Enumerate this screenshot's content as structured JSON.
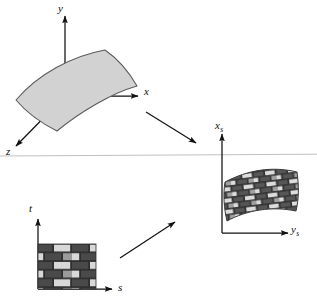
{
  "figure": {
    "kind": "texture-mapping-diagram",
    "background": "#ffffff",
    "divider_y": 155,
    "width": 317,
    "height": 299
  },
  "colors": {
    "stroke": "#1a1a1a",
    "surface_fill": "#d2d2d2",
    "surface_stroke": "#4d4d4d",
    "brick_dark": "#4a4a4a",
    "brick_light": "#d8d8d8",
    "brick_mid": "#9a9a9a",
    "mortar": "#2e2e2e",
    "divider": "#b9b9b9",
    "label": "#0d0d0d"
  },
  "panels": {
    "object_space": {
      "name": "object-space-panel",
      "axes": [
        {
          "id": "y-axis",
          "label": "y",
          "subscript": "",
          "direction": "up",
          "label_x": 58,
          "label_y": 3
        },
        {
          "id": "x-axis",
          "label": "x",
          "subscript": "",
          "direction": "right",
          "label_x": 144,
          "label_y": 91
        },
        {
          "id": "z-axis",
          "label": "z",
          "subscript": "",
          "direction": "down-left",
          "label_x": 6,
          "label_y": 152
        }
      ],
      "surface": {
        "name": "gray-curved-surface",
        "textured": false,
        "fill": "#d2d2d2"
      }
    },
    "texture_space": {
      "name": "texture-space-panel",
      "axes": [
        {
          "id": "t-axis",
          "label": "t",
          "subscript": "",
          "direction": "up",
          "label_x": 28,
          "label_y": 207
        },
        {
          "id": "s-axis",
          "label": "s",
          "subscript": "",
          "direction": "right",
          "label_x": 118,
          "label_y": 278
        }
      ],
      "patch": {
        "name": "brick-texture-square",
        "pattern": "running-bond-brick",
        "rows": 5,
        "cols": 3
      }
    },
    "screen_space": {
      "name": "screen-space-panel",
      "axes": [
        {
          "id": "xs-axis",
          "label": "x",
          "subscript": "s",
          "direction": "up",
          "label_x": 216,
          "label_y": 122
        },
        {
          "id": "ys-axis",
          "label": "y",
          "subscript": "s",
          "direction": "right",
          "label_x": 291,
          "label_y": 228
        }
      ],
      "surface": {
        "name": "textured-curved-surface",
        "textured": true,
        "pattern": "running-bond-brick"
      }
    }
  },
  "mapping_arrows": [
    {
      "name": "object-to-screen-arrow",
      "from": [
        146,
        112
      ],
      "to": [
        196,
        143
      ]
    },
    {
      "name": "texture-to-screen-arrow",
      "from": [
        120,
        258
      ],
      "to": [
        175,
        222
      ]
    }
  ]
}
